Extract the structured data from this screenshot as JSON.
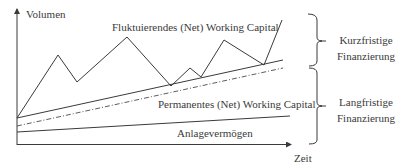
{
  "diagram": {
    "type": "working-capital-financing",
    "y_axis_label": "Volumen",
    "x_axis_label": "Zeit",
    "series": {
      "fluctuating": {
        "label": "Fluktuierendes (Net) Working Capital",
        "style": "solid",
        "points": [
          [
            17,
            118
          ],
          [
            58,
            55
          ],
          [
            77,
            82
          ],
          [
            127,
            37
          ],
          [
            171,
            86
          ],
          [
            190,
            68
          ],
          [
            201,
            77
          ],
          [
            224,
            40
          ],
          [
            264,
            65
          ],
          [
            282,
            20
          ]
        ]
      },
      "permanent": {
        "label": "Permanentes (Net) Working Capital",
        "style": "solid",
        "points": [
          [
            17,
            118
          ],
          [
            283,
            60
          ]
        ]
      },
      "financing_boundary": {
        "label": "",
        "style": "dash-dot",
        "points": [
          [
            17,
            126
          ],
          [
            283,
            68
          ]
        ]
      },
      "fixed_assets": {
        "label": "Anlagevermögen",
        "style": "solid",
        "points": [
          [
            17,
            132
          ],
          [
            290,
            116
          ]
        ]
      }
    },
    "brackets": [
      {
        "label_line1": "Kurzfristige",
        "label_line2": "Finanzierung",
        "y_top": 14,
        "y_bottom": 65
      },
      {
        "label_line1": "Langfristige",
        "label_line2": "Finanzierung",
        "y_top": 65,
        "y_bottom": 144
      }
    ],
    "colors": {
      "line": "#3a3a3a",
      "text": "#3a3a3a",
      "background": "#ffffff"
    }
  }
}
